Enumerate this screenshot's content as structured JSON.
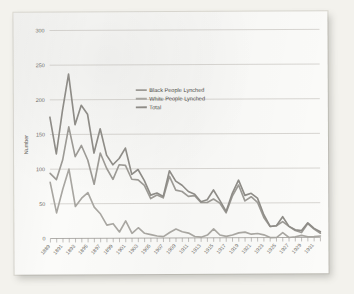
{
  "figure": {
    "background_color": "#f3f2ed",
    "card_color": "#fbfbf9",
    "axis_color": "#8f8d88",
    "grid_color": "#b9b7b1"
  },
  "legend": {
    "position": "inside-upper-center",
    "entries": [
      {
        "label": "Black People Lynched",
        "color": "#9c9a95",
        "swatch_name": "legend-swatch-black-lynched"
      },
      {
        "label": "White People Lynched",
        "color": "#a8a6a1",
        "swatch_name": "legend-swatch-white-lynched"
      },
      {
        "label": "Total",
        "color": "#8e8c87",
        "swatch_name": "legend-swatch-total"
      }
    ]
  },
  "chart_data": {
    "type": "line",
    "title": "",
    "subtitle": "",
    "xlabel": "",
    "ylabel": "Number",
    "xlim": [
      1889,
      1932
    ],
    "ylim": [
      0,
      300
    ],
    "grid": true,
    "legend_position": "inside-upper-center",
    "ytick_labels": [
      "0",
      "50",
      "100",
      "150",
      "200",
      "250",
      "300"
    ],
    "ytick_values": [
      0,
      50,
      100,
      150,
      200,
      250,
      300
    ],
    "x": [
      1889,
      1890,
      1891,
      1892,
      1893,
      1894,
      1895,
      1896,
      1897,
      1898,
      1899,
      1900,
      1901,
      1902,
      1903,
      1904,
      1905,
      1906,
      1907,
      1908,
      1909,
      1910,
      1911,
      1912,
      1913,
      1914,
      1915,
      1916,
      1917,
      1918,
      1919,
      1920,
      1921,
      1922,
      1923,
      1924,
      1925,
      1926,
      1927,
      1928,
      1929,
      1930,
      1931,
      1932
    ],
    "xtick_labels": [
      "1889",
      "1891",
      "1893",
      "1895",
      "1897",
      "1899",
      "1901",
      "1903",
      "1905",
      "1907",
      "1909",
      "1911",
      "1913",
      "1915",
      "1917",
      "1919",
      "1921",
      "1923",
      "1925",
      "1927",
      "1929",
      "1931"
    ],
    "xtick_values": [
      1889,
      1891,
      1893,
      1895,
      1897,
      1899,
      1901,
      1903,
      1905,
      1907,
      1909,
      1911,
      1913,
      1915,
      1917,
      1919,
      1921,
      1923,
      1925,
      1927,
      1929,
      1931
    ],
    "series": [
      {
        "name": "Black People Lynched",
        "color": "#9c9a95",
        "values": [
          94,
          85,
          113,
          161,
          118,
          134,
          113,
          78,
          123,
          101,
          85,
          106,
          105,
          85,
          84,
          76,
          57,
          62,
          58,
          89,
          69,
          67,
          60,
          61,
          51,
          51,
          56,
          50,
          36,
          60,
          76,
          53,
          59,
          51,
          29,
          16,
          17,
          23,
          16,
          10,
          7,
          20,
          12,
          6
        ]
      },
      {
        "name": "White People Lynched",
        "color": "#a8a6a1",
        "values": [
          81,
          37,
          71,
          100,
          46,
          58,
          66,
          45,
          35,
          19,
          21,
          9,
          25,
          7,
          15,
          7,
          5,
          3,
          2,
          8,
          13,
          9,
          7,
          2,
          1,
          4,
          13,
          4,
          2,
          4,
          7,
          8,
          5,
          6,
          4,
          0,
          0,
          7,
          0,
          1,
          3,
          1,
          1,
          2
        ]
      },
      {
        "name": "Total",
        "color": "#8e8c87",
        "values": [
          175,
          122,
          184,
          237,
          164,
          192,
          179,
          123,
          158,
          120,
          106,
          115,
          130,
          92,
          99,
          83,
          62,
          65,
          60,
          97,
          82,
          76,
          67,
          63,
          52,
          55,
          69,
          54,
          38,
          64,
          83,
          61,
          64,
          57,
          33,
          16,
          17,
          30,
          16,
          11,
          10,
          21,
          13,
          8
        ]
      }
    ]
  }
}
